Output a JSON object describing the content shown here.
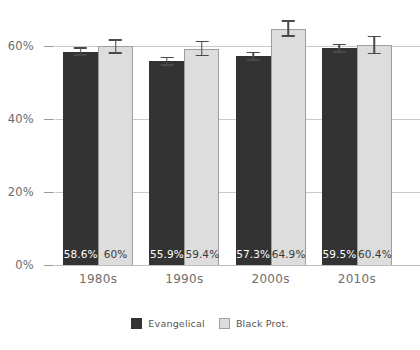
{
  "chart_data": {
    "type": "bar",
    "title": "",
    "subtitle": "",
    "xlabel": "",
    "ylabel": "",
    "categories": [
      "1980s",
      "1990s",
      "2000s",
      "2010s"
    ],
    "ylim": [
      0,
      70
    ],
    "yticks": [
      0,
      20,
      40,
      60
    ],
    "ytick_labels": [
      "0%",
      "20%",
      "40%",
      "60%"
    ],
    "grid": true,
    "legend_position": "bottom-center",
    "value_labels_inside_bars": true,
    "series": [
      {
        "name": "Evangelical",
        "color": "#333333",
        "values": [
          58.6,
          55.9,
          57.3,
          59.5
        ],
        "value_labels": [
          "58.6%",
          "55.9%",
          "57.3%",
          "59.5%"
        ],
        "error_low": [
          57.4,
          54.7,
          56.1,
          58.2
        ],
        "error_high": [
          59.8,
          57.1,
          58.5,
          60.8
        ]
      },
      {
        "name": "Black Prot.",
        "color": "#dddddd",
        "border_color": "#9e9e9e",
        "values": [
          60.0,
          59.4,
          64.9,
          60.4
        ],
        "value_labels": [
          "60%",
          "59.4%",
          "64.9%",
          "60.4%"
        ],
        "error_low": [
          58.0,
          57.3,
          62.6,
          57.9
        ],
        "error_high": [
          62.0,
          61.5,
          67.2,
          62.9
        ]
      }
    ]
  },
  "legend": {
    "items": [
      {
        "label": "Evangelical",
        "swatch": "evangelical"
      },
      {
        "label": "Black Prot.",
        "swatch": "blackprot"
      }
    ]
  },
  "colors": {
    "evangelical": "#333333",
    "black_prot": "#dddddd",
    "black_prot_border": "#9e9e9e",
    "gridline": "#c9c9c9",
    "axis_text": "#6b6b6b",
    "error_bar": "#4a4a4a",
    "background": "#ffffff"
  }
}
